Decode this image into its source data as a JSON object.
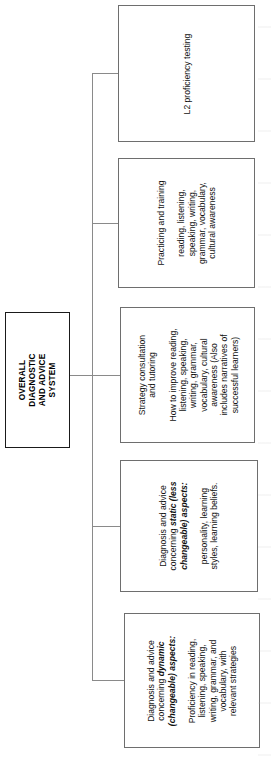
{
  "diagram": {
    "title": "Overall Diagnostic and Advice System",
    "orientation": "rotated-90-ccw",
    "line_color": "#8a8a8a",
    "box_border_color": "#6e6e6e",
    "text_color": "#111111",
    "root": {
      "label": "OVERALL\nDIAGNOSTIC\nAND ADVICE\nSYSTEM"
    },
    "children": [
      {
        "id": "l2-proficiency-testing",
        "heading": "L2 proficiency testing",
        "body": ""
      },
      {
        "id": "practicing-and-training",
        "heading": "Practicing and training",
        "body": "reading, listening,\nspeaking, writing,\ngrammar, vocabulary,\ncultural awareness"
      },
      {
        "id": "strategy-consultation-and-tutoring",
        "heading": "Strategy consultation\nand tutoring",
        "body": "How to improve reading,\nlistening, speaking,\nwriting, grammar,\nvocabulary, cultural\nawareness (Also\nincludes narratives of\nsuccessful learners)"
      },
      {
        "id": "diagnosis-static-aspects",
        "heading_prefix": "Diagnosis and advice\nconcerning ",
        "heading_emphasis": "static (less\nchangeable) aspects:",
        "body": "personality, learning\nstyles, learning beliefs."
      },
      {
        "id": "diagnosis-dynamic-aspects",
        "heading_prefix": "Diagnosis and advice\nconcerning ",
        "heading_emphasis": "dynamic\n(changeable) aspects:",
        "body": "Proficiency in reading,\nlistening, speaking,\nwriting, grammar, and\nvocabulary, with\nrelevant strategies"
      }
    ]
  }
}
